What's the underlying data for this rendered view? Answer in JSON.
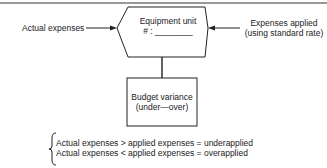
{
  "diagram": {
    "left_input": "Actual expenses",
    "right_input": [
      "Expenses applied",
      "(using standard rate)"
    ],
    "hexagon": {
      "title": "Equipment unit",
      "number_label": "# : ________"
    },
    "box": [
      "Budget variance",
      "(under—over)"
    ],
    "rules": [
      "Actual expenses > applied expenses = underapplied",
      "Actual expenses < applied expenses = overapplied"
    ]
  }
}
